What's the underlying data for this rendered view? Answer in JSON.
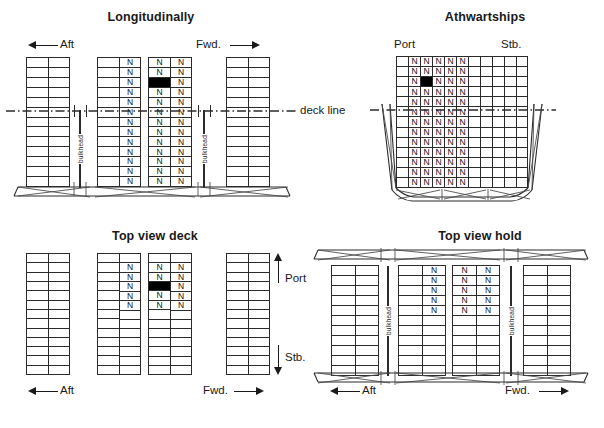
{
  "figure": {
    "caption_cut_off": "",
    "cargo_marker": "N",
    "black_cell_note": ""
  },
  "panels": {
    "longitudinal": {
      "title": "Longitudinally",
      "aft_label": "Aft",
      "fwd_label": "Fwd.",
      "bulkhead_label": "bulkhead",
      "deck_line_label": "deck line",
      "rows": 13,
      "stacks": [
        {
          "cols": 2,
          "n_cols": [],
          "black": null
        },
        {
          "cols": 2,
          "n_cols": [
            1
          ],
          "black": null
        },
        {
          "cols": 2,
          "n_cols": [
            0,
            1
          ],
          "black": {
            "row": 2,
            "col": 0
          }
        },
        {
          "cols": 2,
          "n_cols": [],
          "black": null
        }
      ]
    },
    "athwartships": {
      "title": "Athwartships",
      "port_label": "Port",
      "stb_label": "Stb.",
      "rows": 13,
      "cols": 11,
      "n_cols": [
        1,
        2,
        3,
        4,
        5
      ],
      "black": {
        "row": 2,
        "col": 2
      },
      "upper_rows": 4
    },
    "top_view_deck": {
      "title": "Top view deck",
      "aft_label": "Aft",
      "fwd_label": "Fwd.",
      "port_label": "Port",
      "stb_label": "Stb.",
      "rows": 13,
      "stacks": [
        {
          "cols": 2,
          "n_cols": [],
          "n_rows": [],
          "black": null
        },
        {
          "cols": 2,
          "n_cols": [
            1
          ],
          "n_rows": [
            1,
            2,
            3,
            4,
            5
          ],
          "black": null
        },
        {
          "cols": 2,
          "n_cols": [
            0,
            1
          ],
          "n_rows": [
            1,
            2,
            3,
            4,
            5
          ],
          "black": {
            "row": 3,
            "col": 0
          }
        },
        {
          "cols": 2,
          "n_cols": [],
          "n_rows": [],
          "black": null
        }
      ]
    },
    "top_view_hold": {
      "title": "Top view hold",
      "aft_label": "Aft",
      "fwd_label": "Fwd.",
      "bulkhead_label": "bulkhead",
      "rows": 11,
      "stacks": [
        {
          "cols": 2,
          "n_cols": [],
          "n_rows": [],
          "black": null
        },
        {
          "cols": 2,
          "n_cols": [
            1
          ],
          "n_rows": [
            0,
            1,
            2,
            3,
            4
          ],
          "black": null
        },
        {
          "cols": 2,
          "n_cols": [
            0,
            1
          ],
          "n_rows": [
            0,
            1,
            2,
            3,
            4
          ],
          "black": null
        },
        {
          "cols": 2,
          "n_cols": [],
          "n_rows": [],
          "black": null
        }
      ]
    }
  }
}
